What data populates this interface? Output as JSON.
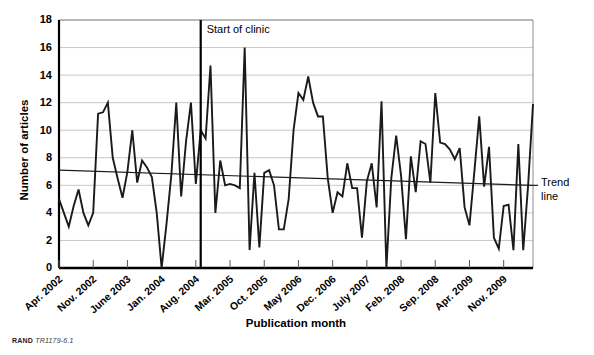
{
  "chart_data": {
    "type": "line",
    "title": "",
    "xlabel": "Publication month",
    "ylabel": "Number of articles",
    "ylim": [
      0,
      18
    ],
    "ytick_values": [
      0,
      2,
      4,
      6,
      8,
      10,
      12,
      14,
      16,
      18
    ],
    "grid": true,
    "legend_position": "right-outside",
    "x_start_label": "Apr. 2002",
    "x_end_label": "Jan. 2010",
    "xtick_labels": [
      "Apr. 2002",
      "Nov. 2002",
      "June 2003",
      "Jan. 2004",
      "Aug. 2004",
      "Mar. 2005",
      "Oct. 2005",
      "May 2006",
      "Dec. 2006",
      "July 2007",
      "Feb. 2008",
      "Sep. 2008",
      "Apr. 2009",
      "Nov. 2009"
    ],
    "xtick_indices": [
      0,
      7,
      14,
      21,
      28,
      35,
      42,
      49,
      56,
      63,
      70,
      77,
      84,
      91
    ],
    "series": [
      {
        "name": "Number of articles",
        "values": [
          5,
          4,
          3,
          4.5,
          5.7,
          4,
          3.1,
          4,
          11.2,
          11.3,
          12,
          8,
          6.5,
          5.1,
          7,
          10,
          6.2,
          7.8,
          7.3,
          6.6,
          4,
          0,
          3.2,
          6.8,
          12,
          5.2,
          9.2,
          12,
          6.1,
          10,
          9.4,
          14.7,
          4,
          7.8,
          6,
          6.1,
          6,
          5.8,
          16,
          1.3,
          6.9,
          1.5,
          6.9,
          7.1,
          6,
          2.8,
          2.8,
          5,
          10,
          12.7,
          12.2,
          13.9,
          12,
          11,
          11,
          6.5,
          4,
          5.5,
          5.2,
          7.6,
          5.8,
          5.8,
          2.2,
          6.3,
          7.6,
          4.4,
          12.1,
          0,
          6.5,
          9.6,
          6.7,
          2.1,
          8.1,
          5.5,
          9.2,
          9,
          6.2,
          12.7,
          9.1,
          9,
          8.6,
          7.9,
          8.7,
          4.4,
          3.1,
          7,
          11,
          5.9,
          8.8,
          2.2,
          1.4,
          4.5,
          4.6,
          1.3,
          9,
          1.3,
          6,
          11.9
        ]
      }
    ],
    "trend_line": {
      "name": "Trend line",
      "label": "Trend\nline",
      "label_line1": "Trend",
      "label_line2": "line",
      "y_start": 7.1,
      "y_end": 6.0
    },
    "annotations": [
      {
        "name": "start-of-clinic",
        "text": "Start of clinic",
        "x_index": 29,
        "type": "vertical-line"
      }
    ]
  },
  "footer": {
    "rand_mark": "RAND",
    "rand_id": "TR1179-6.1"
  },
  "colors": {
    "series": "#1a1a1a",
    "grid": "#b9b9b9",
    "axis": "#000000",
    "background": "#ffffff"
  }
}
